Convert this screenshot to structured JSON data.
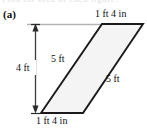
{
  "figure": {
    "part_label": "(a)",
    "shape": "parallelogram",
    "cut_off_text_top": "Find the area of each figure.",
    "labels": {
      "top_edge": "1 ft 4 in",
      "bottom_edge": "1 ft 4 in",
      "height": "4 ft",
      "left_side": "5 ft",
      "right_side": "5 ft"
    },
    "colors": {
      "outline": "#1a1a1a",
      "fill": "#f4f4f4",
      "guideline": "#b4b4b4",
      "dimension_line": "#3c3c3c",
      "text": "#111111",
      "background": "#ffffff"
    },
    "geometry": {
      "top_left_vertex": [
        102,
        24
      ],
      "top_right_vertex": [
        143,
        24
      ],
      "bottom_right_vertex": [
        83,
        113
      ],
      "bottom_left_vertex": [
        41,
        113
      ],
      "guideline_start_x": 27,
      "guideline_y": 24,
      "dimension_line_x": 35,
      "dimension_line_top_y": 24,
      "dimension_line_bottom_y": 113
    }
  }
}
